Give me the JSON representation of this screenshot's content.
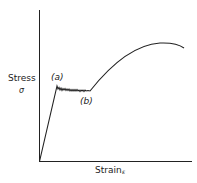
{
  "diagram": {
    "type": "stress-strain curve",
    "y_axis": {
      "label": "Stress",
      "symbol": "σ"
    },
    "x_axis": {
      "label": "Strain",
      "symbol": "ε"
    },
    "points": [
      {
        "label": "(a)",
        "description": "upper yield point"
      },
      {
        "label": "(b)",
        "description": "end of yield plateau / lower yield"
      }
    ],
    "colors": {
      "line": "#222222",
      "background": "#ffffff"
    }
  }
}
